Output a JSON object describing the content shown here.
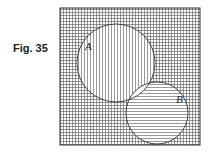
{
  "figure": {
    "label": "Fig. 35"
  },
  "diagram": {
    "type": "venn",
    "sets": [
      {
        "name": "A",
        "shading": "vertical-lines"
      },
      {
        "name": "B",
        "shading": "horizontal-lines"
      }
    ],
    "universe_shading": "grid",
    "intersection_shading": "none",
    "colors": {
      "ink": "#333333",
      "background": "#ffffff"
    }
  }
}
